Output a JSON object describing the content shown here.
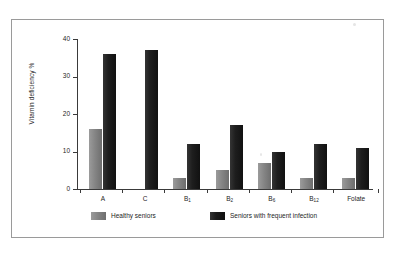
{
  "figure": {
    "frame_border_color": "#9a9a9a",
    "background_color": "#ffffff"
  },
  "chart_data": {
    "type": "bar",
    "title": "",
    "subtitle": "",
    "xlabel": "",
    "ylabel": "Vitamin deficiency %",
    "categories": [
      "A",
      "C",
      "B1",
      "B2",
      "B6",
      "B12",
      "Folate"
    ],
    "category_labels": [
      {
        "base": "A",
        "sub": ""
      },
      {
        "base": "C",
        "sub": ""
      },
      {
        "base": "B",
        "sub": "1"
      },
      {
        "base": "B",
        "sub": "2"
      },
      {
        "base": "B",
        "sub": "6"
      },
      {
        "base": "B",
        "sub": "12"
      },
      {
        "base": "Folate",
        "sub": ""
      }
    ],
    "series": [
      {
        "name": "Healthy seniors",
        "color": "#7d7d7d",
        "values": [
          16,
          0,
          3,
          5,
          7,
          3,
          3
        ]
      },
      {
        "name": "Seniors with frequent infection",
        "color": "#1a1a1a",
        "values": [
          36,
          37,
          12,
          17,
          10,
          12,
          11
        ]
      }
    ],
    "ylim": [
      0,
      40
    ],
    "yticks": [
      0,
      10,
      20,
      30,
      40
    ],
    "ytick_labels": [
      "0",
      "10",
      "20",
      "30",
      "40"
    ],
    "grid": false,
    "legend_position": "bottom"
  },
  "legend": {
    "items": [
      {
        "label": "Healthy seniors",
        "color": "#7d7d7d"
      },
      {
        "label": "Seniors with frequent infection",
        "color": "#1a1a1a"
      }
    ]
  }
}
